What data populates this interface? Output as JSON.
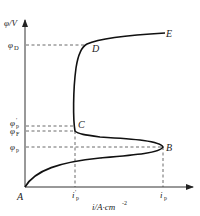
{
  "diagram": {
    "y_axis": {
      "label": "φ/V"
    },
    "x_axis": {
      "label_main": "i/A·cm",
      "label_exp": "-2"
    },
    "points": {
      "A": "A",
      "B": "B",
      "C": "C",
      "D": "D",
      "E": "E"
    },
    "y_ticks": [
      {
        "sym": "φ",
        "sub": "D",
        "prime": ""
      },
      {
        "sym": "φ",
        "sub": "p",
        "prime": "′"
      },
      {
        "sym": "φ",
        "sub": "F",
        "prime": ""
      },
      {
        "sym": "φ",
        "sub": "p",
        "prime": ""
      }
    ],
    "x_ticks": [
      {
        "sym": "i",
        "sub": "p",
        "prime": "′"
      },
      {
        "sym": "i",
        "sub": "p",
        "prime": ""
      }
    ]
  }
}
